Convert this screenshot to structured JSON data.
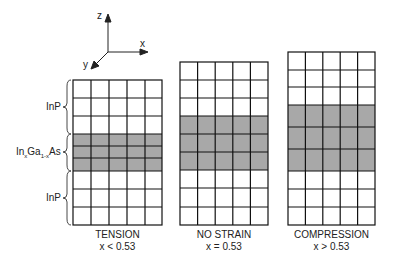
{
  "axes": {
    "z": "z",
    "x": "x",
    "y": "y"
  },
  "layer_labels": {
    "top": "InP",
    "middle_prefix": "In",
    "middle_sub1": "x",
    "middle_mid": "Ga",
    "middle_sub2": "1-x",
    "middle_suffix": "As",
    "bottom": "InP"
  },
  "panels": [
    {
      "title": "TENSION",
      "condition": "x < 0.53"
    },
    {
      "title": "NO STRAIN",
      "condition": "x = 0.53"
    },
    {
      "title": "COMPRESSION",
      "condition": "x > 0.53"
    }
  ],
  "colors": {
    "grid_line": "#111111",
    "shaded_layer": "#a8a8a8",
    "cell": "#ffffff"
  }
}
